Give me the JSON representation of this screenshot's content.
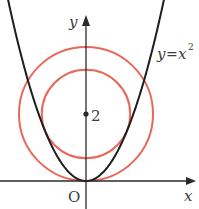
{
  "figure": {
    "curve_label_lhs": "y",
    "curve_label_eq": "=",
    "curve_label_rhs": "x",
    "curve_label_exp": "2",
    "x_axis_label": "x",
    "y_axis_label": "y",
    "origin_label": "O",
    "center_label": "2"
  },
  "math": {
    "parabola": "y = x^2",
    "center": [
      0,
      2
    ],
    "outer_circle_radius": 2,
    "inner_circle_radius": 1.32
  },
  "colors": {
    "axis": "#2a2a2a",
    "parabola": "#1e1e1e",
    "circle": "#e8685a"
  }
}
